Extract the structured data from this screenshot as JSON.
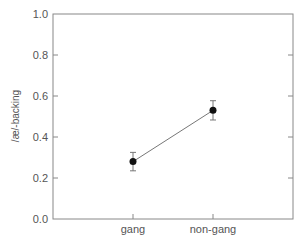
{
  "chart_data": {
    "type": "line",
    "title": "",
    "xlabel": "",
    "ylabel": "/æ/-backing",
    "categories": [
      "gang",
      "non-gang"
    ],
    "series": [
      {
        "name": "/æ/-backing",
        "values": [
          0.28,
          0.53
        ],
        "error": [
          0.045,
          0.047
        ]
      }
    ],
    "ylim": [
      0.0,
      1.0
    ],
    "yticks": [
      "0.0",
      "0.2",
      "0.4",
      "0.6",
      "0.8",
      "1.0"
    ],
    "grid": false,
    "legend": "none",
    "colors": {
      "frame": "#888888",
      "line": "#888888",
      "marker": "#111111",
      "text": "#555555"
    }
  }
}
